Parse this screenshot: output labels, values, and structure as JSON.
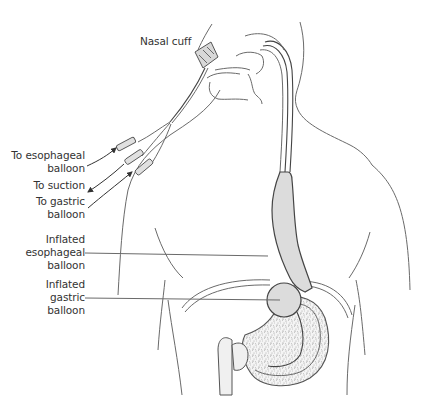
{
  "diagram": {
    "type": "anatomical illustration",
    "colors": {
      "line": "#6a6a6a",
      "balloon_fill": "#dcdcdc",
      "text": "#333333",
      "background": "#ffffff"
    },
    "labels": {
      "nasal_cuff": "Nasal cuff",
      "to_esophageal_balloon": [
        "To esophageal",
        "balloon"
      ],
      "to_suction": [
        "To suction"
      ],
      "to_gastric_balloon": [
        "To gastric",
        "balloon"
      ],
      "inflated_esophageal_balloon": [
        "Inflated",
        "esophageal",
        "balloon"
      ],
      "inflated_gastric_balloon": [
        "Inflated",
        "gastric",
        "balloon"
      ]
    },
    "arrows": [
      {
        "label": "To esophageal balloon",
        "direction": "toward tube"
      },
      {
        "label": "To suction",
        "direction": "away from tube"
      },
      {
        "label": "To gastric balloon",
        "direction": "toward tube"
      }
    ]
  }
}
